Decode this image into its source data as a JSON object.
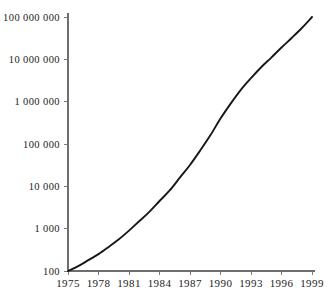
{
  "chart_data": {
    "type": "line",
    "title": "",
    "subtitle": "",
    "xlabel": "",
    "ylabel": "",
    "x": [
      1975,
      1976,
      1977,
      1978,
      1979,
      1980,
      1981,
      1982,
      1983,
      1984,
      1985,
      1986,
      1987,
      1988,
      1989,
      1990,
      1991,
      1992,
      1993,
      1994,
      1995,
      1996,
      1997,
      1998,
      1999
    ],
    "values": [
      100,
      130,
      180,
      250,
      370,
      560,
      900,
      1500,
      2500,
      4500,
      8000,
      16000,
      32000,
      70000,
      160000,
      400000,
      900000,
      1900000,
      3600000,
      6500000,
      11000000,
      19000000,
      32000000,
      55000000,
      100000000
    ],
    "series": [
      {
        "name": "hosts",
        "values": [
          100,
          130,
          180,
          250,
          370,
          560,
          900,
          1500,
          2500,
          4500,
          8000,
          16000,
          32000,
          70000,
          160000,
          400000,
          900000,
          1900000,
          3600000,
          6500000,
          11000000,
          19000000,
          32000000,
          55000000,
          100000000
        ]
      }
    ],
    "yscale": "log",
    "ylim": [
      100,
      100000000
    ],
    "xlim": [
      1975,
      1999
    ],
    "grid": false,
    "legend": false,
    "legend_position": "none",
    "line_color": "#171717",
    "axis_color": "#6e6e6e",
    "background_color": "#ffffff",
    "y_ticks": [
      {
        "value": 100,
        "label": "100"
      },
      {
        "value": 1000,
        "label": "1 000"
      },
      {
        "value": 10000,
        "label": "10 000"
      },
      {
        "value": 100000,
        "label": "100 000"
      },
      {
        "value": 1000000,
        "label": "1 000 000"
      },
      {
        "value": 10000000,
        "label": "10 000 000"
      },
      {
        "value": 100000000,
        "label": "100 000 000"
      }
    ],
    "x_ticks": [
      {
        "value": 1975,
        "label": "1975"
      },
      {
        "value": 1978,
        "label": "1978"
      },
      {
        "value": 1981,
        "label": "1981"
      },
      {
        "value": 1984,
        "label": "1984"
      },
      {
        "value": 1987,
        "label": "1987"
      },
      {
        "value": 1990,
        "label": "1990"
      },
      {
        "value": 1993,
        "label": "1993"
      },
      {
        "value": 1996,
        "label": "1996"
      },
      {
        "value": 1999,
        "label": "1999"
      }
    ]
  }
}
